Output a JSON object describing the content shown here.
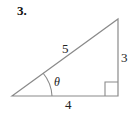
{
  "problem": {
    "number": "3."
  },
  "figure": {
    "type": "right-triangle",
    "hypotenuse_label": "5",
    "opposite_label": "3",
    "adjacent_label": "4",
    "angle_label": "θ",
    "stroke_color": "#8a8a8a"
  }
}
